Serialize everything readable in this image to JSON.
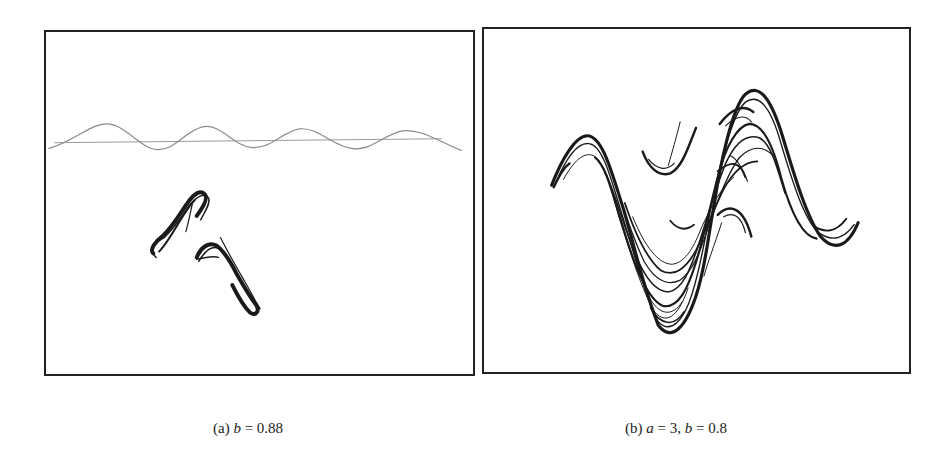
{
  "figure": {
    "panels": [
      {
        "id": "a",
        "caption_prefix": "(a) ",
        "caption_var1": "b",
        "caption_eq1": " = 0.88",
        "description": "Attractor with two hook-shaped fragments below a wavy horizontal line"
      },
      {
        "id": "b",
        "caption_prefix": "(b) ",
        "caption_var1": "a",
        "caption_eq1": " = 3, ",
        "caption_var2": "b",
        "caption_eq2": " = 0.8",
        "description": "Strange attractor with layered S-shaped (sinusoidal) folded bands"
      }
    ],
    "colors": {
      "ink": "#1a1a1a",
      "faint_line": "#8a8a8a",
      "border": "#222222",
      "background": "#ffffff"
    }
  }
}
